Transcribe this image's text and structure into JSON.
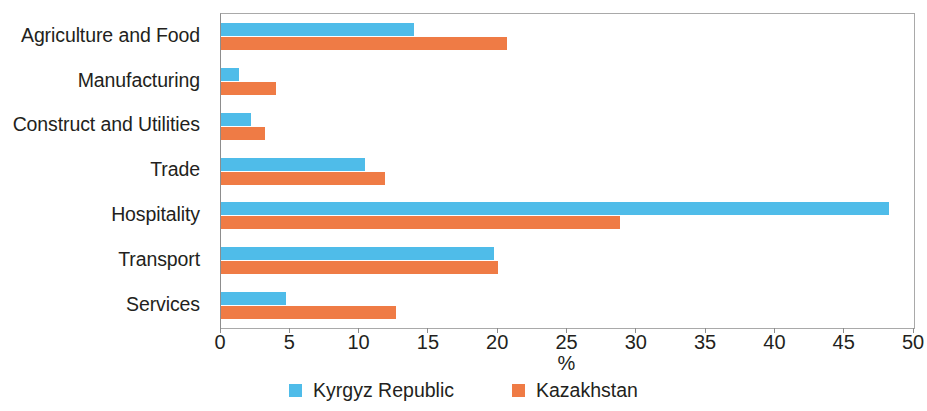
{
  "chart_data": {
    "type": "bar",
    "orientation": "horizontal",
    "title": "",
    "xlabel": "%",
    "ylabel": "",
    "xlim": [
      0,
      50
    ],
    "xticks": [
      0,
      5,
      10,
      15,
      20,
      25,
      30,
      35,
      40,
      45,
      50
    ],
    "xtick_labels": [
      "0",
      "5",
      "10",
      "15",
      "20",
      "25",
      "30",
      "35",
      "40",
      "45",
      "50"
    ],
    "grid": false,
    "legend_position": "bottom-center",
    "categories": [
      "Agriculture and Food",
      "Manufacturing",
      "Construct and Utilities",
      "Trade",
      "Hospitality",
      "Transport",
      "Services"
    ],
    "series": [
      {
        "name": "Kyrgyz Republic",
        "color": "#4FBCE9",
        "values": [
          13.9,
          1.3,
          2.2,
          10.4,
          48.2,
          19.7,
          4.7
        ]
      },
      {
        "name": "Kazakhstan",
        "color": "#EF7B45",
        "values": [
          20.6,
          4.0,
          3.2,
          11.8,
          28.8,
          20.0,
          12.6
        ]
      }
    ]
  }
}
